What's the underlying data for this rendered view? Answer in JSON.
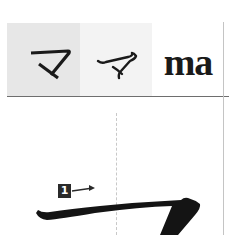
{
  "header": {
    "kana_block": "マ",
    "kana_cursive": "マ",
    "romaji": "ma"
  },
  "stroke_diagram": {
    "character": "マ",
    "stroke_number": "1",
    "direction": "arrow-right"
  },
  "colors": {
    "cell_block_bg": "#e7e7e7",
    "cell_cursive_bg": "#f3f3f3",
    "ink": "#1a1a1a",
    "badge_bg": "#2a2a2a",
    "guide": "#c8c8c8"
  }
}
